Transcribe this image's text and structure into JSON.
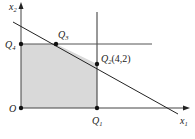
{
  "diagram": {
    "type": "linear-programming-feasible-region",
    "axes": {
      "x_label": "x",
      "x_sub": "1",
      "y_label": "x",
      "y_sub": "2",
      "origin_label": "O"
    },
    "points": [
      {
        "id": "O",
        "label": "O",
        "sub": ""
      },
      {
        "id": "Q1",
        "label": "Q",
        "sub": "1"
      },
      {
        "id": "Q2",
        "label": "Q",
        "sub": "2",
        "coords": "(4,2)"
      },
      {
        "id": "Q3",
        "label": "Q",
        "sub": "3"
      },
      {
        "id": "Q4",
        "label": "Q",
        "sub": "4"
      }
    ],
    "region_fill": "#d9d9d9",
    "line_color": "#222222"
  }
}
